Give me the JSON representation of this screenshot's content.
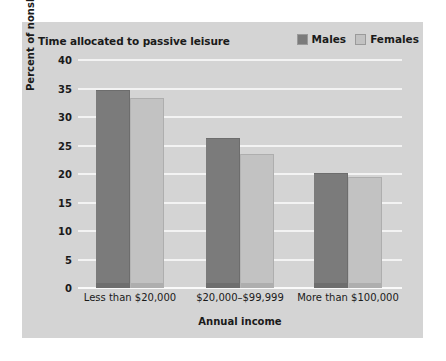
{
  "chart_data": {
    "type": "bar",
    "title": "Time allocated to passive leisure",
    "xlabel": "Annual income",
    "ylabel": "Percent of nonsleep time",
    "categories": [
      "Less than $20,000",
      "$20,000–$99,999",
      "More than $100,000"
    ],
    "series": [
      {
        "name": "Males",
        "color": "#7b7b7b",
        "values": [
          34.7,
          26.3,
          20.2
        ]
      },
      {
        "name": "Females",
        "color": "#c2c2c2",
        "values": [
          33.4,
          23.5,
          19.5
        ]
      }
    ],
    "ylim": [
      0,
      40
    ],
    "yticks": [
      0,
      5,
      10,
      15,
      20,
      25,
      30,
      35,
      40
    ],
    "ytick_labels": [
      "0",
      "5",
      "10",
      "15",
      "20",
      "25",
      "30",
      "35",
      "40"
    ],
    "grid": true,
    "grid_color": "#f3f3f3",
    "legend_position": "top-right",
    "panel_color": "#d4d4d4",
    "background_color": "#ffffff"
  }
}
